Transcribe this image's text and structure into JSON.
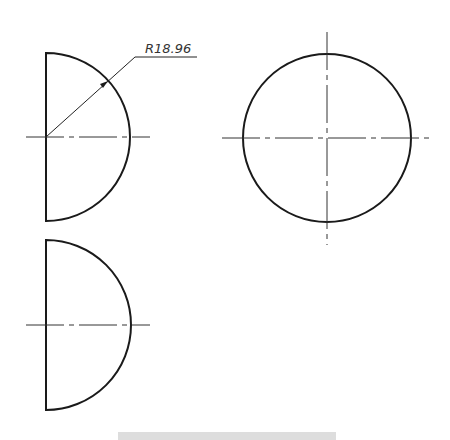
{
  "drawing": {
    "type": "orthographic three-view of a hemisphere",
    "dimension": {
      "label": "R18.96",
      "kind": "radius"
    },
    "views": [
      {
        "name": "front-view",
        "shape": "half-disc",
        "center": [
          46,
          137
        ],
        "radius": 84
      },
      {
        "name": "side-view",
        "shape": "circle",
        "center": [
          327,
          138
        ],
        "radius": 84
      },
      {
        "name": "top-view",
        "shape": "half-disc",
        "center": [
          46,
          325
        ],
        "radius": 85
      }
    ],
    "colors": {
      "outline": "#1a1a1a",
      "centerline": "#333333",
      "background": "#ffffff"
    }
  },
  "caption": {
    "text": ""
  }
}
